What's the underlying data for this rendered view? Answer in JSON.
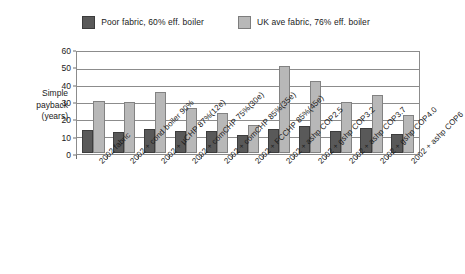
{
  "chart_data": {
    "type": "bar",
    "title": "",
    "xlabel": "",
    "ylabel": "Simple payback (years)",
    "ylim": [
      0,
      60
    ],
    "yticks": [
      0,
      10,
      20,
      30,
      40,
      50,
      60
    ],
    "grid": true,
    "legend_position": "top-center",
    "categories": [
      "2002 fabric",
      "2002 + cond boiler 90%",
      "2002 + µCHP 87%(12e)",
      "2002 + comCHP 75%(30e)",
      "2002 + comCHP 85%(35e)",
      "2002 + FCCHP 85%(45e)",
      "2002 + ashp COP2.5",
      "2002 + gshp COP3.2",
      "2002 + ashp COP3.7",
      "2002 + gshp COP4.0",
      "2002 + ashp COP6"
    ],
    "series": [
      {
        "name": "Poor fabric, 60% eff. boiler",
        "color": "#595959",
        "values": [
          14,
          12.5,
          14.5,
          13.5,
          13,
          11,
          14.5,
          16,
          13,
          15,
          11.5
        ]
      },
      {
        "name": "UK ave fabric, 76% eff. boiler",
        "color": "#b8b8b8",
        "values": [
          31.5,
          30.5,
          36.5,
          27,
          24,
          17,
          52,
          43,
          30.5,
          35,
          23
        ]
      }
    ]
  },
  "axis_title": {
    "line1": "Simple",
    "line2": "payback",
    "line3": "(years)"
  }
}
